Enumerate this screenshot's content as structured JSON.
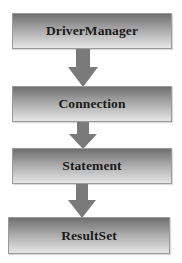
{
  "diagram": {
    "type": "flow",
    "direction": "top-to-bottom",
    "nodes": [
      {
        "id": "driver-manager",
        "label": "DriverManager"
      },
      {
        "id": "connection",
        "label": "Connection"
      },
      {
        "id": "statement",
        "label": "Statement"
      },
      {
        "id": "resultset",
        "label": "ResultSet"
      }
    ],
    "edges": [
      {
        "from": "driver-manager",
        "to": "connection"
      },
      {
        "from": "connection",
        "to": "statement"
      },
      {
        "from": "statement",
        "to": "resultset"
      }
    ],
    "colors": {
      "box_top": "#6f6f6f",
      "box_bottom": "#e6e6e6",
      "arrow": "#7a7a7a",
      "text": "#1a1a1a"
    }
  }
}
